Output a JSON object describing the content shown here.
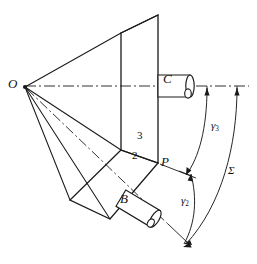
{
  "figure": {
    "background_color": "#ffffff",
    "line_color": "#1a1a1a",
    "width": 257,
    "height": 264
  },
  "labels": {
    "apex": "O",
    "point_p": "P",
    "cylinder_c": "C",
    "cylinder_b": "B",
    "plane_2": "2",
    "plane_3": "3",
    "angle_gamma2": "γ",
    "angle_gamma2_sub": "2",
    "angle_gamma3": "γ",
    "angle_gamma3_sub": "3",
    "angle_sigma": "Σ"
  },
  "geometry": {
    "apex_point": {
      "x": 24,
      "y": 86
    },
    "point_p": {
      "x": 158,
      "y": 163
    },
    "axis_line_y": 86,
    "vertical_plane": [
      {
        "x": 121,
        "y": 33
      },
      {
        "x": 158,
        "y": 15
      },
      {
        "x": 158,
        "y": 163
      },
      {
        "x": 121,
        "y": 150
      }
    ],
    "inclined_plane": [
      {
        "x": 121,
        "y": 150
      },
      {
        "x": 158,
        "y": 163
      },
      {
        "x": 110,
        "y": 219
      },
      {
        "x": 70,
        "y": 200
      }
    ],
    "cylinder_c": {
      "x": 158,
      "y": 72,
      "w": 36,
      "h": 22
    },
    "cylinder_b": {
      "cx": 140,
      "cy": 209,
      "w": 42,
      "h": 19,
      "rotation": 30
    },
    "arc_gamma3": {
      "from_deg": 0,
      "to_deg": 27
    },
    "arc_sigma": {
      "from_deg": 0,
      "to_deg": 46
    },
    "arc_gamma2": {
      "from_deg": 27,
      "to_deg": 46
    }
  }
}
